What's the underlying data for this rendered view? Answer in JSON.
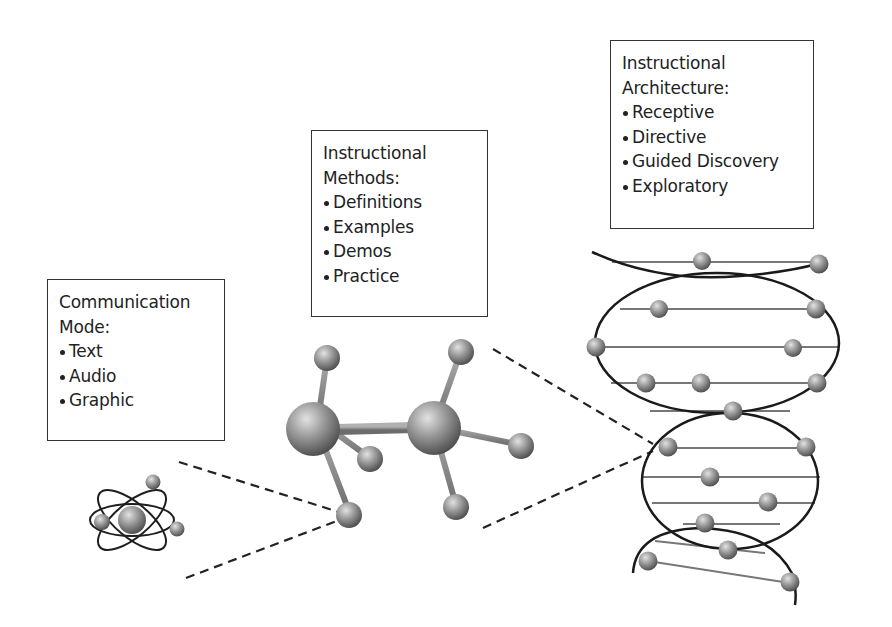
{
  "diagram": {
    "boxes": [
      {
        "id": "communication-mode",
        "title_line1": "Communication",
        "title_line2": "Mode:",
        "items": [
          "Text",
          "Audio",
          "Graphic"
        ],
        "illustration": "atom-icon"
      },
      {
        "id": "instructional-methods",
        "title_line1": "Instructional",
        "title_line2": "Methods:",
        "items": [
          "Definitions",
          "Examples",
          "Demos",
          "Practice"
        ],
        "illustration": "molecule-icon"
      },
      {
        "id": "instructional-architecture",
        "title_line1": "Instructional",
        "title_line2": "Architecture:",
        "items": [
          "Receptive",
          "Directive",
          "Guided Discovery",
          "Exploratory"
        ],
        "illustration": "dna-helix-icon"
      }
    ],
    "colors": {
      "line": "#222222",
      "box_border": "#333333",
      "sphere_light": "#d6d6d6",
      "sphere_dark": "#5a5a5a",
      "bond": "#8a8a8a"
    }
  }
}
